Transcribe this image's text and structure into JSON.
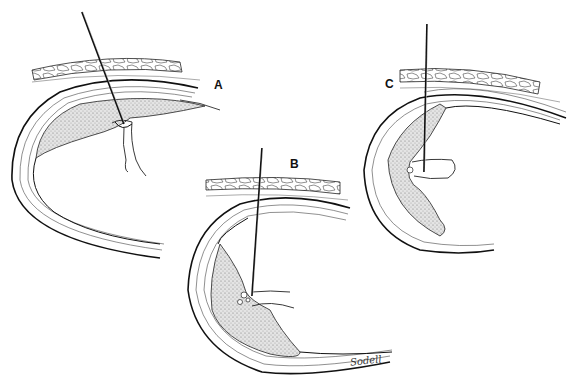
{
  "figure": {
    "type": "medical-illustration",
    "panels": [
      {
        "id": "A",
        "label": "A",
        "label_pos": [
          214,
          84
        ],
        "description": "Needle passing through fat and wall layers into lumen, tip at junction with branch"
      },
      {
        "id": "B",
        "label": "B",
        "label_pos": [
          290,
          163
        ],
        "description": "Needle passing into thickened wall with sinuses at branching vessel"
      },
      {
        "id": "C",
        "label": "C",
        "label_pos": [
          386,
          83
        ],
        "description": "Needle passing vertically into wall, tip within branching vessel"
      }
    ],
    "signature": "Sodell",
    "colors": {
      "ink": "#111111",
      "stipple": "#c8c8c8",
      "background": "#ffffff"
    }
  }
}
